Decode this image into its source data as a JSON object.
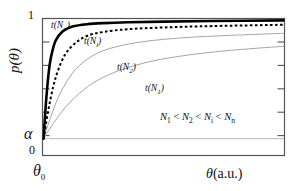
{
  "figure": {
    "background_color": "#ffffff",
    "frame_color": "#555555"
  },
  "axes": {
    "ylabel": "p(θ)",
    "ylabel_symbol": "p",
    "ylabel_arg": "(θ)",
    "xlabel_symbol": "θ",
    "xlabel_units": "(a.u.)",
    "ytick_top": "1",
    "ytick_zero": "0",
    "ytick_alpha": "α",
    "xtick_origin": "θ",
    "xtick_origin_sub": "0"
  },
  "annotations": {
    "inequality_prefix": "N",
    "inequality": "N₁ < N₂ < Nᵢ < Nₙ",
    "inequality_parts": {
      "n1": "N",
      "n1s": "1",
      "op1": " < ",
      "n2": "N",
      "n2s": "2",
      "op2": " < ",
      "n3": "N",
      "n3s": "i",
      "op3": " < ",
      "n4": "N",
      "n4s": "n"
    }
  },
  "chart_data": {
    "type": "line",
    "title": "",
    "xlabel": "θ(a.u.)",
    "ylabel": "p(θ)",
    "xlim": [
      0,
      1
    ],
    "ylim": [
      0,
      1
    ],
    "grid": false,
    "legend": "inline-curve-labels",
    "xtick_labels": [
      "θ₀"
    ],
    "ytick_labels": [
      "0",
      "α",
      "1"
    ],
    "ytick_values": [
      0,
      0.12,
      1
    ],
    "reference_lines": [
      {
        "name": "alpha-level",
        "orientation": "horizontal",
        "y": 0.12,
        "color": "#b8b8b8",
        "style": "solid"
      }
    ],
    "common_origin": {
      "x": 0.0,
      "y": 0.12,
      "label": "(θ₀, α)"
    },
    "series": [
      {
        "name": "t(Nn)",
        "label": "t(Nₙ)",
        "label_fn": "t(N",
        "label_sub": "n",
        "label_end": ")",
        "style": "solid",
        "width": 2.6,
        "color": "#000000",
        "saturation": 0.985,
        "rate": 34,
        "x": [
          0.0,
          0.01,
          0.02,
          0.03,
          0.05,
          0.08,
          0.12,
          0.18,
          0.25,
          0.35,
          0.5,
          0.7,
          1.0
        ],
        "y": [
          0.12,
          0.38,
          0.58,
          0.71,
          0.84,
          0.91,
          0.945,
          0.962,
          0.97,
          0.976,
          0.981,
          0.985,
          0.99
        ]
      },
      {
        "name": "t(Ni)",
        "label": "t(Nᵢ)",
        "label_fn": "t(N",
        "label_sub": "i",
        "label_end": ")",
        "style": "dashed",
        "width": 2.0,
        "color": "#000000",
        "saturation": 0.945,
        "rate": 16,
        "x": [
          0.0,
          0.02,
          0.04,
          0.06,
          0.09,
          0.13,
          0.18,
          0.25,
          0.35,
          0.5,
          0.7,
          1.0
        ],
        "y": [
          0.12,
          0.33,
          0.5,
          0.62,
          0.74,
          0.82,
          0.875,
          0.905,
          0.925,
          0.938,
          0.948,
          0.958
        ]
      },
      {
        "name": "t(N2)",
        "label": "t(N₂)",
        "label_fn": "t(N",
        "label_sub": "2",
        "label_end": ")",
        "style": "solid",
        "width": 0.9,
        "color": "#9a9a9a",
        "saturation": 0.86,
        "rate": 8,
        "x": [
          0.0,
          0.03,
          0.06,
          0.1,
          0.15,
          0.22,
          0.3,
          0.42,
          0.58,
          0.78,
          1.0
        ],
        "y": [
          0.12,
          0.28,
          0.42,
          0.55,
          0.66,
          0.745,
          0.795,
          0.835,
          0.862,
          0.88,
          0.895
        ]
      },
      {
        "name": "t(N1)",
        "label": "t(N₁)",
        "label_fn": "t(N",
        "label_sub": "1",
        "label_end": ")",
        "style": "solid",
        "width": 0.9,
        "color": "#9a9a9a",
        "saturation": 0.74,
        "rate": 4.2,
        "x": [
          0.0,
          0.04,
          0.09,
          0.15,
          0.22,
          0.32,
          0.45,
          0.6,
          0.78,
          1.0
        ],
        "y": [
          0.12,
          0.23,
          0.35,
          0.455,
          0.545,
          0.625,
          0.69,
          0.735,
          0.77,
          0.8
        ]
      }
    ]
  }
}
